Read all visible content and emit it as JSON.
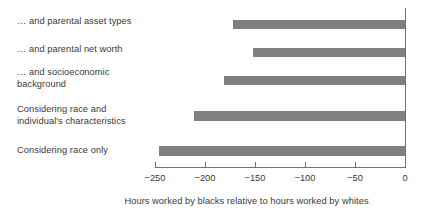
{
  "chart_data": {
    "type": "bar",
    "orientation": "horizontal",
    "title": "",
    "xlabel": "Hours worked by blacks relative to hours worked by whites",
    "ylabel": "",
    "xlim": [
      -250,
      0
    ],
    "grid": false,
    "legend": null,
    "bar_color": "#808080",
    "axis_color": "#6f6f6f",
    "text_color": "#3a3a3a",
    "xticks": [
      -250,
      -200,
      -150,
      -100,
      -50,
      0
    ],
    "xtick_labels": [
      "−250",
      "−200",
      "−150",
      "−100",
      "−50",
      "0"
    ],
    "categories": [
      "… and parental asset types",
      "… and parental net worth",
      "… and socioeconomic\nbackground",
      "Considering race and\nindividual's characteristics",
      "Considering race only"
    ],
    "values": [
      -172,
      -152,
      -181,
      -211,
      -246
    ]
  }
}
